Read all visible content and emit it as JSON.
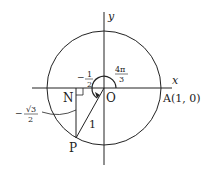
{
  "diagram": {
    "axes": {
      "x_label": "x",
      "y_label": "y"
    },
    "points": {
      "origin": "O",
      "A": "A(1, 0)",
      "N": "N",
      "P": "P"
    },
    "labels": {
      "angle_num": "4π",
      "angle_den": "3",
      "cos_sign": "−",
      "cos_num": "1",
      "cos_den": "2",
      "sin_sign": "−",
      "sin_num": "√3",
      "sin_den": "2",
      "radius": "1"
    },
    "colors": {
      "stroke": "#222222",
      "background": "#ffffff"
    }
  }
}
